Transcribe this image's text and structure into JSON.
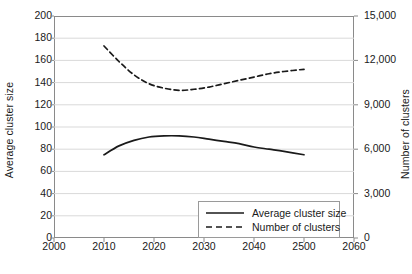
{
  "chart_data": {
    "type": "line",
    "title": "",
    "xlabel": "",
    "ylabel": "Average cluster size",
    "y2label": "Number of clusters",
    "xlim": [
      2000,
      2060
    ],
    "ylim": [
      0,
      200
    ],
    "y2lim": [
      0,
      15000
    ],
    "grid": true,
    "legend_position": "bottom-right",
    "xticks": [
      "2000",
      "2010",
      "2020",
      "2030",
      "2040",
      "2500",
      "2060"
    ],
    "xtick_values": [
      2000,
      2010,
      2020,
      2030,
      2040,
      2050,
      2060
    ],
    "yticks_left": [
      "0",
      "20",
      "40",
      "60",
      "80",
      "100",
      "120",
      "140",
      "160",
      "180",
      "200"
    ],
    "ytick_left_values": [
      0,
      20,
      40,
      60,
      80,
      100,
      120,
      140,
      160,
      180,
      200
    ],
    "yticks_right": [
      "0",
      "3,000",
      "6,000",
      "9,000",
      "12,000",
      "15,000"
    ],
    "ytick_right_values": [
      0,
      3000,
      6000,
      9000,
      12000,
      15000
    ],
    "series": [
      {
        "name": "Average cluster size",
        "axis": "left",
        "style": "solid",
        "color": "#1a1a1a",
        "x": [
          2010,
          2013,
          2016,
          2019,
          2022,
          2025,
          2028,
          2031,
          2034,
          2037,
          2040,
          2043,
          2046,
          2050
        ],
        "values": [
          75,
          83,
          88,
          91,
          92,
          92,
          91,
          89,
          87,
          85,
          82,
          80,
          78,
          75
        ]
      },
      {
        "name": "Number of clusters",
        "axis": "left_scaled_equivalent",
        "style": "dashed",
        "color": "#1a1a1a",
        "x": [
          2010,
          2013,
          2016,
          2019,
          2022,
          2025,
          2028,
          2031,
          2034,
          2037,
          2040,
          2043,
          2046,
          2050
        ],
        "values": [
          173,
          159,
          147,
          139,
          135,
          133,
          134,
          136,
          139,
          142,
          145,
          148,
          150,
          152
        ],
        "values_right_axis": [
          12975,
          11925,
          11025,
          10425,
          10125,
          9975,
          10050,
          10200,
          10425,
          10650,
          10875,
          11100,
          11250,
          11400
        ]
      }
    ],
    "legend": [
      {
        "label": "Average cluster size",
        "style": "solid"
      },
      {
        "label": "Number of clusters",
        "style": "dashed"
      }
    ]
  },
  "colors": {
    "axis": "#8a8a8a",
    "grid": "#d9d9d9",
    "text": "#1a1a1a",
    "line": "#1a1a1a",
    "background": "#ffffff"
  }
}
